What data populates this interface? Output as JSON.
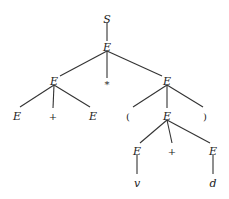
{
  "diagram": {
    "type": "parse-tree",
    "nodes": [
      {
        "id": "n0",
        "label": "S",
        "x": 107,
        "y": 19,
        "italic": true
      },
      {
        "id": "n1",
        "label": "E",
        "x": 107,
        "y": 47,
        "italic": true
      },
      {
        "id": "n2",
        "label": "E",
        "x": 54,
        "y": 81,
        "italic": true
      },
      {
        "id": "n3",
        "label": "*",
        "x": 107,
        "y": 84,
        "italic": false
      },
      {
        "id": "n4",
        "label": "E",
        "x": 167,
        "y": 81,
        "italic": true
      },
      {
        "id": "n5",
        "label": "E",
        "x": 17,
        "y": 116,
        "italic": true
      },
      {
        "id": "n6",
        "label": "+",
        "x": 53,
        "y": 116,
        "italic": false
      },
      {
        "id": "n7",
        "label": "E",
        "x": 93,
        "y": 116,
        "italic": true
      },
      {
        "id": "n8",
        "label": "(",
        "x": 128,
        "y": 116,
        "italic": false
      },
      {
        "id": "n9",
        "label": "E",
        "x": 167,
        "y": 116,
        "italic": true
      },
      {
        "id": "n10",
        "label": ")",
        "x": 205,
        "y": 116,
        "italic": false
      },
      {
        "id": "n11",
        "label": "E",
        "x": 137,
        "y": 151,
        "italic": true
      },
      {
        "id": "n12",
        "label": "+",
        "x": 172,
        "y": 151,
        "italic": false
      },
      {
        "id": "n13",
        "label": "E",
        "x": 213,
        "y": 151,
        "italic": true
      },
      {
        "id": "n14",
        "label": "v",
        "x": 137,
        "y": 183,
        "italic": true
      },
      {
        "id": "n15",
        "label": "d",
        "x": 213,
        "y": 183,
        "italic": true
      }
    ],
    "edges": [
      {
        "from": [
          107,
          23
        ],
        "to": [
          107,
          41
        ]
      },
      {
        "from": [
          107,
          51
        ],
        "to": [
          60,
          76
        ]
      },
      {
        "from": [
          107,
          51
        ],
        "to": [
          107,
          78
        ]
      },
      {
        "from": [
          107,
          51
        ],
        "to": [
          162,
          76
        ]
      },
      {
        "from": [
          54,
          85
        ],
        "to": [
          20,
          107
        ]
      },
      {
        "from": [
          54,
          85
        ],
        "to": [
          53,
          108
        ]
      },
      {
        "from": [
          54,
          85
        ],
        "to": [
          90,
          107
        ]
      },
      {
        "from": [
          167,
          85
        ],
        "to": [
          133,
          107
        ]
      },
      {
        "from": [
          167,
          85
        ],
        "to": [
          167,
          108
        ]
      },
      {
        "from": [
          167,
          85
        ],
        "to": [
          203,
          107
        ]
      },
      {
        "from": [
          167,
          120
        ],
        "to": [
          140,
          143
        ]
      },
      {
        "from": [
          167,
          120
        ],
        "to": [
          172,
          143
        ]
      },
      {
        "from": [
          167,
          120
        ],
        "to": [
          210,
          143
        ]
      },
      {
        "from": [
          137,
          155
        ],
        "to": [
          137,
          174
        ]
      },
      {
        "from": [
          213,
          155
        ],
        "to": [
          213,
          174
        ]
      }
    ]
  }
}
